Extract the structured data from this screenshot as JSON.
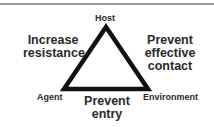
{
  "diagram": {
    "type": "epidemiologic-triangle",
    "vertices": {
      "top": "Host",
      "bottom_left": "Agent",
      "bottom_right": "Environment"
    },
    "side_labels": {
      "left": [
        "Increase",
        "resistance"
      ],
      "right": [
        "Prevent",
        "effective",
        "contact"
      ],
      "bottom": [
        "Prevent",
        "entry"
      ]
    },
    "colors": {
      "stroke": "#111111",
      "text": "#2a2a2a",
      "rule": "#9a9a9a",
      "background": "#ffffff"
    }
  }
}
